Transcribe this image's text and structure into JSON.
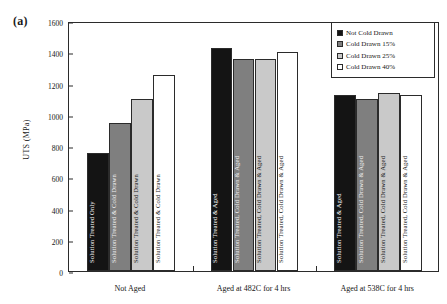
{
  "figure": {
    "panel_label": "(a)",
    "ylabel": "UTS (MPa)"
  },
  "legend": {
    "items": [
      {
        "label": "Not Cold Drawn",
        "color": "#141414"
      },
      {
        "label": "Cold Drawn 15%",
        "color": "#7f7f7f"
      },
      {
        "label": "Cold Drawn 25%",
        "color": "#c9c9c9"
      },
      {
        "label": "Cold Drawn 40%",
        "color": "#ffffff"
      }
    ]
  },
  "chart_data": {
    "type": "bar",
    "title": "",
    "xlabel": "",
    "ylabel": "UTS (MPa)",
    "ylim": [
      0,
      1600
    ],
    "yticks": [
      0,
      200,
      400,
      600,
      800,
      1000,
      1200,
      1400,
      1600
    ],
    "grid": false,
    "legend_position": "top-right",
    "categories": [
      "Not Aged",
      "Aged at 482C for 4 hrs",
      "Aged at 538C for 4 hrs"
    ],
    "series": [
      {
        "name": "Not Cold Drawn",
        "values": [
          755,
          1430,
          1125
        ]
      },
      {
        "name": "Cold Drawn 15%",
        "values": [
          950,
          1355,
          1100
        ]
      },
      {
        "name": "Cold Drawn 25%",
        "values": [
          1100,
          1355,
          1140
        ]
      },
      {
        "name": "Cold Drawn 40%",
        "values": [
          1255,
          1400,
          1125
        ]
      }
    ],
    "bar_labels": [
      [
        "Solution Treated Only",
        "Solution Treated & Cold Drawn",
        "Solution Treated & Cold Drawn",
        "Solution Treated & Cold Drawn"
      ],
      [
        "Solution Treated & Aged",
        "Solution Treated, Cold Drawn & Aged",
        "Solution Treated, Cold Drawn & Aged",
        "Solution Treated, Cold Drawn & Aged"
      ],
      [
        "Solution Treated & Aged",
        "Solution Treated, Cold Drawn & Aged",
        "Solution Treated, Cold Drawn & Aged",
        "Solution Treated, Cold Drawn & Aged"
      ]
    ]
  }
}
